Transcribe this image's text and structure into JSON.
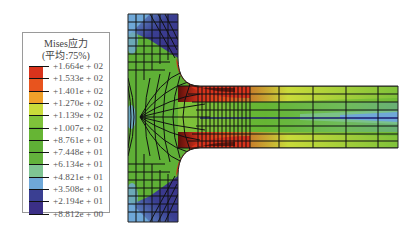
{
  "legend": {
    "title": "Mises应力",
    "subtitle": "(平均:75%)",
    "labels": [
      "+1.664e + 02",
      "+1.533e + 02",
      "+1.401e + 02",
      "+1.270e + 02",
      "+1.139e + 02",
      "+1.007e + 02",
      "+8.761e + 01",
      "+7.448e + 01",
      "+6.134e + 01",
      "+4.821e + 01",
      "+3.508e + 01",
      "+2.194e + 01",
      "+8.812e + 00"
    ],
    "colors": [
      "#d9331c",
      "#e8541e",
      "#f0a02a",
      "#c9db3a",
      "#7fc23a",
      "#66b534",
      "#5fb036",
      "#63b23c",
      "#7fc493",
      "#6fa8d8",
      "#3a3f92",
      "#3b2f86"
    ]
  },
  "model": {
    "type": "T-shaped flange FEA mesh contour",
    "quantity": "Mises stress",
    "max": "+1.664e + 02",
    "min": "+8.812e + 00"
  }
}
